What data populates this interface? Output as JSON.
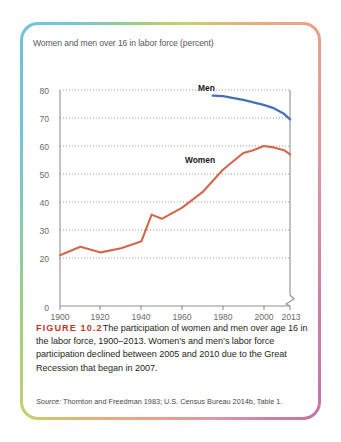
{
  "figure": {
    "plot_title": "Women and men over 16 in labor force (percent)",
    "figure_number": "FIGURE 10.2",
    "caption": "The participation of women and men over age 16 in the labor force, 1900–2013. Women’s and men’s labor force participation declined between 2005 and 2010 due to the Great Recession that began in 2007.",
    "source_label": "Source:",
    "source_text": " Thornton and Freedman 1983; U.S. Census Bureau 2014b, Table 1."
  },
  "chart_data": {
    "type": "line",
    "title": "Women and men over 16 in labor force (percent)",
    "xlabel": "",
    "ylabel": "",
    "xlim": [
      1900,
      2013
    ],
    "ylim": [
      0,
      80
    ],
    "yticks": [
      0,
      20,
      30,
      40,
      50,
      60,
      70,
      80
    ],
    "ytick_labels": [
      "0",
      "20",
      "30",
      "40",
      "50",
      "60",
      "70",
      "80"
    ],
    "xticks": [
      1900,
      1920,
      1940,
      1960,
      1980,
      2000,
      2013
    ],
    "xtick_labels": [
      "1900",
      "1920",
      "1940",
      "1960",
      "1980",
      "2000",
      "2013"
    ],
    "grid": "horizontal-dotted",
    "y_axis_break": true,
    "legend": "inline-labels",
    "colors": {
      "women": "#d4674a",
      "men": "#4472b8",
      "grid": "#9a9a9c",
      "axis": "#8a8a8c"
    },
    "series": [
      {
        "name": "Women",
        "color": "#d4674a",
        "x": [
          1900,
          1910,
          1920,
          1930,
          1940,
          1945,
          1950,
          1960,
          1970,
          1980,
          1990,
          1995,
          2000,
          2005,
          2010,
          2013
        ],
        "values": [
          21,
          24,
          22,
          23.5,
          26,
          35.5,
          34,
          38,
          43.5,
          51.5,
          57.5,
          58.5,
          60,
          59.5,
          58.5,
          57
        ]
      },
      {
        "name": "Men",
        "color": "#4472b8",
        "x": [
          1975,
          1980,
          1990,
          2000,
          2005,
          2010,
          2013
        ],
        "values": [
          78,
          77.8,
          76.5,
          74.7,
          73.5,
          71.5,
          69.5
        ]
      }
    ],
    "annotations": [
      {
        "text": "Men",
        "x": 1962,
        "y": 79
      },
      {
        "text": "Women",
        "x": 1957,
        "y": 53.5
      }
    ]
  }
}
